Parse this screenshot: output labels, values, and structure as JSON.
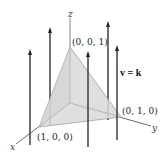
{
  "diagram": {
    "axes": {
      "x_label": "x",
      "y_label": "y",
      "z_label": "z"
    },
    "vertices": {
      "z_vertex": "(0, 0, 1)",
      "x_vertex": "(1, 0, 0)",
      "y_vertex": "(0, 1, 0)"
    },
    "field_label": "v = k",
    "colors": {
      "surface_fill": "#d9d9d9",
      "surface_edge": "#a0a0a0",
      "arrow": "#222222",
      "axis": "#555555"
    }
  }
}
